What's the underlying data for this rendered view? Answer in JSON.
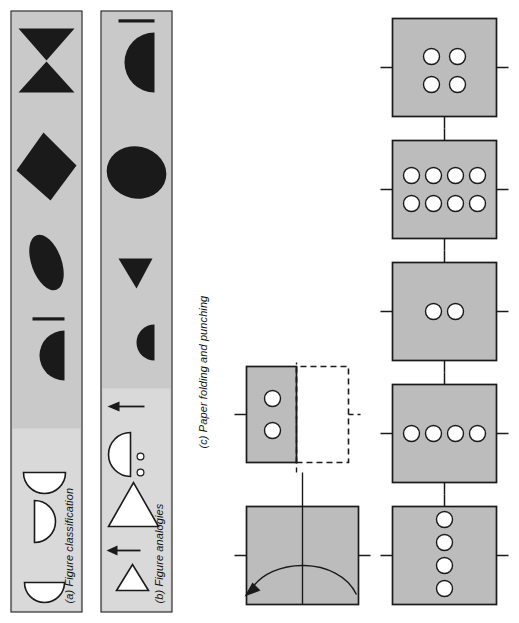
{
  "figure": {
    "orientation": "rotated-90-ccw",
    "background": "#ffffff",
    "panel_fill": "#c9c9c9",
    "panel_light_fill": "#d9d9d9",
    "ink": "#1a1a1a"
  },
  "panels": [
    {
      "id": "a",
      "caption_lead": "(a)",
      "caption_text": "Figure classification",
      "stem_shapes": [
        "bowtie",
        "diamond",
        "tilted-ellipse",
        "half-disc-with-bar"
      ],
      "option_shapes": [
        "half-disc-right",
        "half-disc-down",
        "half-disc-right-2"
      ]
    },
    {
      "id": "b",
      "caption_lead": "(b)",
      "caption_text": "Figure analogies",
      "stem_shapes": [
        "half-disc-with-bar",
        "ellipse",
        "small-triangle-left",
        "small-half-disc"
      ],
      "option_shapes": [
        "triangle-left-outline",
        "triangle-left-large-outline",
        "half-disc-outline"
      ],
      "connectors": [
        "arrow-up",
        "arrow-up"
      ],
      "dots": [
        "dot",
        "dot"
      ]
    },
    {
      "id": "c",
      "caption_lead": "(c)",
      "caption_text": "Paper folding and punching",
      "sequence": [
        {
          "name": "folded-sheet-with-fold-arrow",
          "holes": 0
        },
        {
          "name": "punched-sheet",
          "holes": 2
        }
      ],
      "options": [
        {
          "label": "F",
          "holes": 4,
          "arrangement": "row-of-4"
        },
        {
          "label": "G",
          "holes": 4,
          "arrangement": "column-of-4"
        },
        {
          "label": "H",
          "holes": 2,
          "arrangement": "column-of-2"
        },
        {
          "label": "J",
          "holes": 8,
          "arrangement": "grid-4x2"
        },
        {
          "label": "K",
          "holes": 4,
          "arrangement": "grid-2x2"
        }
      ]
    }
  ]
}
